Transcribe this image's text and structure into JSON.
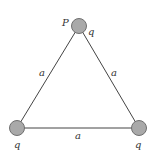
{
  "diagram": {
    "vertices": [
      {
        "id": "top",
        "point_label": "P",
        "charge_label": "q",
        "cx": 79,
        "cy": 26
      },
      {
        "id": "bottom-left",
        "charge_label": "q",
        "cx": 17,
        "cy": 128
      },
      {
        "id": "bottom-right",
        "charge_label": "q",
        "cx": 139,
        "cy": 128
      }
    ],
    "sides": {
      "left": "a",
      "right": "a",
      "bottom": "a"
    },
    "colors": {
      "charge_fill": "#a9a9a9",
      "charge_stroke": "#6f6f6f",
      "line": "#444444"
    }
  }
}
